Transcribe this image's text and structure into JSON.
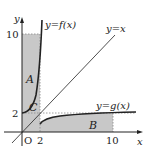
{
  "diagram": {
    "axes": {
      "x_label": "x",
      "y_label": "y",
      "origin_label": "O"
    },
    "ticks": {
      "x": [
        "2",
        "10"
      ],
      "y": [
        "2",
        "10"
      ]
    },
    "curves": [
      {
        "name": "f",
        "label": "y=f(x)"
      },
      {
        "name": "identity",
        "label": "y=x"
      },
      {
        "name": "g",
        "label": "y=g(x)"
      }
    ],
    "regions": [
      {
        "name": "A",
        "label": "A"
      },
      {
        "name": "B",
        "label": "B"
      },
      {
        "name": "C",
        "label": "C"
      }
    ],
    "colors": {
      "shade": "#c8c8c8",
      "line": "#222222",
      "dotted": "#888888"
    }
  }
}
